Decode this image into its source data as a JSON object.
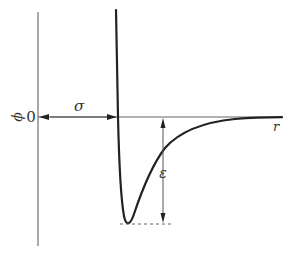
{
  "diagram": {
    "y_axis_label": "ϕ",
    "zero_label": "0",
    "x_axis_label": "r",
    "sigma_label": "σ",
    "epsilon_label": "ε",
    "colors": {
      "axis": "#555555",
      "curve": "#222222",
      "arrow": "#444444",
      "dashed": "#666666",
      "text": "#333333"
    }
  }
}
